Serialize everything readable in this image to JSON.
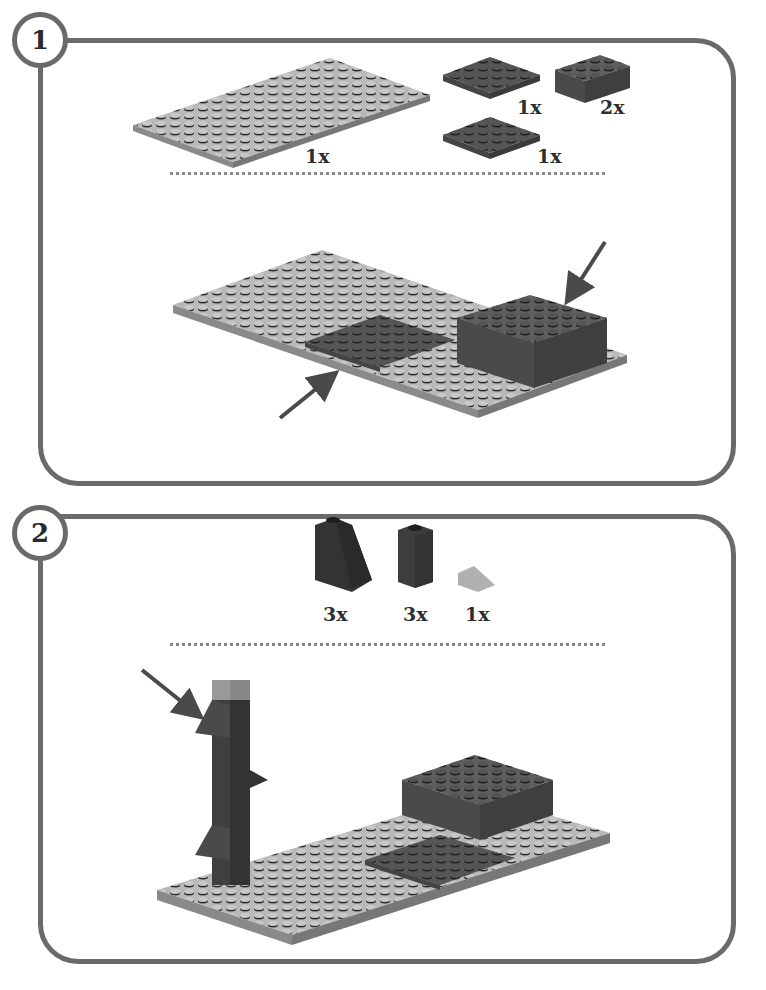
{
  "steps": [
    {
      "number": "1",
      "parts": [
        {
          "name": "large light gray plate",
          "qty": "1x"
        },
        {
          "name": "dark gray 4x4 plate",
          "qty": "1x"
        },
        {
          "name": "dark gray 2x4 brick",
          "qty": "2x"
        },
        {
          "name": "dark gray 4x4 plate",
          "qty": "1x"
        }
      ]
    },
    {
      "number": "2",
      "parts": [
        {
          "name": "dark slope 1x2",
          "qty": "3x"
        },
        {
          "name": "dark brick 1x1",
          "qty": "3x"
        },
        {
          "name": "light gray slope",
          "qty": "1x"
        }
      ]
    }
  ],
  "colors": {
    "frame": "#6a6a6a",
    "light_plate": "#b8b8b8",
    "dark_part": "#5a5a5a",
    "darker_part": "#3a3a3a",
    "arrow": "#4a4a4a"
  }
}
